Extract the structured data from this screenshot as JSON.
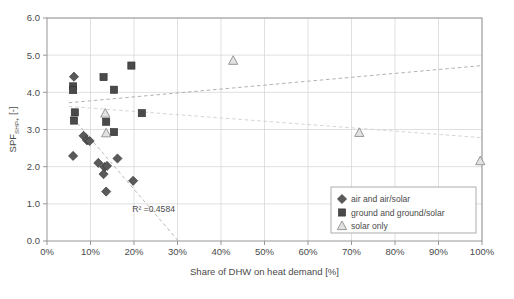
{
  "chart_data": {
    "type": "scatter",
    "title": "",
    "xlabel": "Share of DHW on heat demand [%]",
    "ylabel": "SPF",
    "ylabel_sub": "SHP+",
    "ylabel_unit": "[-]",
    "xlim": [
      0,
      100
    ],
    "ylim": [
      0,
      6
    ],
    "xticks": [
      0,
      10,
      20,
      30,
      40,
      50,
      60,
      70,
      80,
      90,
      100
    ],
    "xtick_labels": [
      "0%",
      "10%",
      "20%",
      "30%",
      "40%",
      "50%",
      "60%",
      "70%",
      "80%",
      "90%",
      "100%"
    ],
    "yticks": [
      0,
      1,
      2,
      3,
      4,
      5,
      6
    ],
    "ytick_labels": [
      "0.0",
      "1.0",
      "2.0",
      "3.0",
      "4.0",
      "5.0",
      "6.0"
    ],
    "grid": true,
    "legend_position": "bottom-right",
    "annotations": [
      {
        "name": "r2-annotation",
        "text": "R² =0.4584",
        "x": 24.5,
        "y": 0.78
      }
    ],
    "series": [
      {
        "name": "air and air/solar",
        "marker": "diamond",
        "color": "#5a5a5a",
        "points": [
          {
            "x": 6.2,
            "y": 4.42
          },
          {
            "x": 6.0,
            "y": 2.29
          },
          {
            "x": 8.4,
            "y": 2.83
          },
          {
            "x": 9.2,
            "y": 2.71
          },
          {
            "x": 9.8,
            "y": 2.69
          },
          {
            "x": 11.8,
            "y": 2.1
          },
          {
            "x": 13.2,
            "y": 1.99
          },
          {
            "x": 13.8,
            "y": 2.02
          },
          {
            "x": 13.0,
            "y": 1.8
          },
          {
            "x": 13.6,
            "y": 1.33
          },
          {
            "x": 16.2,
            "y": 2.22
          },
          {
            "x": 19.8,
            "y": 1.62
          }
        ]
      },
      {
        "name": "ground and ground/solar",
        "marker": "square",
        "color": "#4a4a4a",
        "points": [
          {
            "x": 6.0,
            "y": 4.16
          },
          {
            "x": 6.0,
            "y": 4.06
          },
          {
            "x": 6.4,
            "y": 3.46
          },
          {
            "x": 6.2,
            "y": 3.24
          },
          {
            "x": 13.0,
            "y": 4.41
          },
          {
            "x": 15.4,
            "y": 4.07
          },
          {
            "x": 13.6,
            "y": 3.21
          },
          {
            "x": 15.4,
            "y": 2.93
          },
          {
            "x": 19.4,
            "y": 4.72
          },
          {
            "x": 21.8,
            "y": 3.44
          }
        ]
      },
      {
        "name": "solar only",
        "marker": "triangle",
        "color": "#b4b4b4",
        "points": [
          {
            "x": 13.4,
            "y": 3.43
          },
          {
            "x": 13.6,
            "y": 2.9
          },
          {
            "x": 42.8,
            "y": 4.85
          },
          {
            "x": 71.8,
            "y": 2.91
          },
          {
            "x": 99.6,
            "y": 2.15
          }
        ]
      }
    ],
    "trendlines": [
      {
        "name": "upward-trendline",
        "x1": 5.0,
        "y1": 3.72,
        "x2": 100.0,
        "y2": 4.72,
        "style": "dashed",
        "color": "#a8a8a8"
      },
      {
        "name": "flat-trendline",
        "x1": 5.0,
        "y1": 3.62,
        "x2": 100.0,
        "y2": 2.78,
        "style": "dashed",
        "color": "#cfcfcf"
      },
      {
        "name": "downward-trendline",
        "x1": 6.0,
        "y1": 3.3,
        "x2": 30.2,
        "y2": 0.0,
        "style": "dashed",
        "color": "#b0b0b0"
      }
    ],
    "legend": [
      {
        "label": "air and air/solar",
        "marker": "diamond"
      },
      {
        "label": "ground and ground/solar",
        "marker": "square"
      },
      {
        "label": "solar only",
        "marker": "triangle"
      }
    ]
  }
}
